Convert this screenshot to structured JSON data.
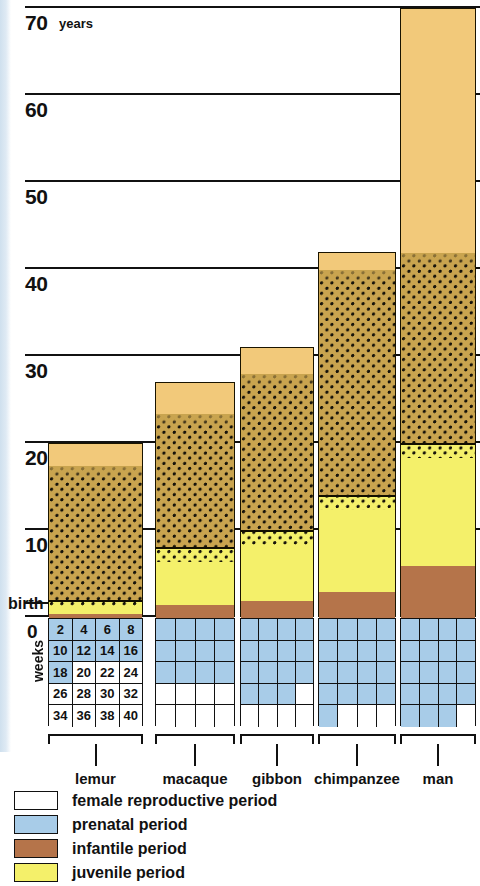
{
  "axis": {
    "unit": "years",
    "birth_label": "birth",
    "ticks": [
      {
        "value": 70,
        "label": "70"
      },
      {
        "value": 60,
        "label": "60"
      },
      {
        "value": 50,
        "label": "50"
      },
      {
        "value": 40,
        "label": "40"
      },
      {
        "value": 30,
        "label": "30"
      },
      {
        "value": 20,
        "label": "20"
      },
      {
        "value": 10,
        "label": "10"
      },
      {
        "value": 0,
        "label": "0"
      }
    ]
  },
  "weeks": {
    "caption": "weeks",
    "rows": [
      [
        "2",
        "4",
        "6",
        "8"
      ],
      [
        "10",
        "12",
        "14",
        "16"
      ],
      [
        "18",
        "20",
        "22",
        "24"
      ],
      [
        "26",
        "28",
        "30",
        "32"
      ],
      [
        "34",
        "36",
        "38",
        "40"
      ]
    ]
  },
  "colors": {
    "adult": "#f2c97a",
    "reproductive_base": "#c9a44f",
    "juvenile": "#f4f06a",
    "infantile": "#b5744a",
    "prenatal": "#a8cce8",
    "prenatal_empty": "#ffffff",
    "ink": "#111111"
  },
  "legend": [
    {
      "key": "female-reproductive",
      "label": "female reproductive period",
      "swatch": "dots"
    },
    {
      "key": "prenatal",
      "label": "prenatal period",
      "swatch": "prenatal"
    },
    {
      "key": "infantile",
      "label": "infantile period",
      "swatch": "infantile"
    },
    {
      "key": "juvenile",
      "label": "juvenile period",
      "swatch": "juvenile"
    }
  ],
  "chart_data": {
    "type": "bar",
    "title": "",
    "subtitle": "",
    "xlabel": "",
    "ylabel": "years",
    "ylim": [
      0,
      70
    ],
    "grid": true,
    "legend_position": "below",
    "stacked": true,
    "categories": [
      "lemur",
      "macaque",
      "gibbon",
      "chimpanzee",
      "man"
    ],
    "secondary_axis": {
      "name": "weeks",
      "unit": "weeks",
      "range": [
        0,
        40
      ],
      "tick_step": 2,
      "direction": "below-zero",
      "description": "prenatal gestation grid, each cell = 2 weeks"
    },
    "series": [
      {
        "name": "prenatal period (weeks gestation)",
        "key": "prenatal",
        "unit": "weeks",
        "values": [
          18,
          24,
          30,
          34,
          38
        ]
      },
      {
        "name": "infantile period (years)",
        "key": "infantile",
        "unit": "years",
        "values": [
          0.5,
          1.5,
          2.0,
          3.0,
          6.0
        ]
      },
      {
        "name": "juvenile period (years)",
        "key": "juvenile",
        "unit": "years",
        "values": [
          1.5,
          6.5,
          8.0,
          11.0,
          14.0
        ]
      },
      {
        "name": "female reproductive period (years)",
        "key": "reproductive",
        "unit": "years",
        "values": [
          15.5,
          15.5,
          18.0,
          26.0,
          22.0
        ]
      },
      {
        "name": "post-reproductive adult period (years)",
        "key": "adult",
        "unit": "years",
        "values": [
          2.5,
          3.5,
          3.0,
          2.0,
          28.0
        ]
      }
    ],
    "totals_years": [
      20,
      27,
      31,
      42,
      70
    ],
    "annotations": [
      {
        "text": "birth",
        "at_y": 0
      },
      {
        "text": "years",
        "at_y": 70
      }
    ]
  },
  "bars": [
    {
      "name": "lemur",
      "total_years": 20,
      "gestation_weeks": 18,
      "prenatal_cells": 9,
      "segments": [
        {
          "key": "infantile",
          "from": 0.0,
          "to": 0.5
        },
        {
          "key": "juvenile",
          "from": 0.5,
          "to": 2.0
        },
        {
          "key": "reproductive",
          "from": 2.0,
          "to": 17.5
        },
        {
          "key": "adult",
          "from": 17.5,
          "to": 20.0
        }
      ]
    },
    {
      "name": "macaque",
      "total_years": 27,
      "gestation_weeks": 24,
      "prenatal_cells": 12,
      "segments": [
        {
          "key": "infantile",
          "from": 0.0,
          "to": 1.5
        },
        {
          "key": "juvenile",
          "from": 1.5,
          "to": 8.0
        },
        {
          "key": "reproductive",
          "from": 8.0,
          "to": 23.5
        },
        {
          "key": "adult",
          "from": 23.5,
          "to": 27.0
        }
      ]
    },
    {
      "name": "gibbon",
      "total_years": 31,
      "gestation_weeks": 30,
      "prenatal_cells": 15,
      "segments": [
        {
          "key": "infantile",
          "from": 0.0,
          "to": 2.0
        },
        {
          "key": "juvenile",
          "from": 2.0,
          "to": 10.0
        },
        {
          "key": "reproductive",
          "from": 10.0,
          "to": 28.0
        },
        {
          "key": "adult",
          "from": 28.0,
          "to": 31.0
        }
      ]
    },
    {
      "name": "chimpanzee",
      "total_years": 42,
      "gestation_weeks": 34,
      "prenatal_cells": 17,
      "segments": [
        {
          "key": "infantile",
          "from": 0.0,
          "to": 3.0
        },
        {
          "key": "juvenile",
          "from": 3.0,
          "to": 14.0
        },
        {
          "key": "reproductive",
          "from": 14.0,
          "to": 40.0
        },
        {
          "key": "adult",
          "from": 40.0,
          "to": 42.0
        }
      ]
    },
    {
      "name": "man",
      "total_years": 70,
      "gestation_weeks": 38,
      "prenatal_cells": 19,
      "segments": [
        {
          "key": "infantile",
          "from": 0.0,
          "to": 6.0
        },
        {
          "key": "juvenile",
          "from": 6.0,
          "to": 20.0
        },
        {
          "key": "reproductive",
          "from": 20.0,
          "to": 42.0
        },
        {
          "key": "adult",
          "from": 42.0,
          "to": 70.0
        }
      ]
    }
  ]
}
